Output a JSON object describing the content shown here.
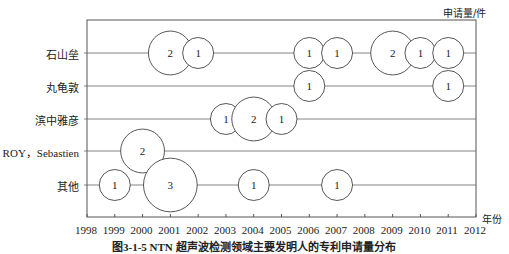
{
  "chart_data": {
    "type": "bubble",
    "title": "",
    "unit_label": "申请量/件",
    "xlabel": "年份",
    "ylabel": "",
    "x_ticks": [
      1998,
      1999,
      2000,
      2001,
      2002,
      2003,
      2004,
      2005,
      2006,
      2007,
      2008,
      2009,
      2010,
      2011,
      2012
    ],
    "xlim": [
      1998,
      2012
    ],
    "categories": [
      "石山垒",
      "丸龟敦",
      "滨中雅彦",
      "ROY，Sebastien",
      "其他"
    ],
    "series": [
      {
        "name": "石山垒",
        "points": [
          {
            "x": 2001,
            "v": 2
          },
          {
            "x": 2002,
            "v": 1
          },
          {
            "x": 2006,
            "v": 1
          },
          {
            "x": 2007,
            "v": 1
          },
          {
            "x": 2009,
            "v": 2
          },
          {
            "x": 2010,
            "v": 1
          },
          {
            "x": 2011,
            "v": 1
          }
        ]
      },
      {
        "name": "丸龟敦",
        "points": [
          {
            "x": 2006,
            "v": 1
          },
          {
            "x": 2011,
            "v": 1
          }
        ]
      },
      {
        "name": "滨中雅彦",
        "points": [
          {
            "x": 2003,
            "v": 1
          },
          {
            "x": 2004,
            "v": 2
          },
          {
            "x": 2005,
            "v": 1
          }
        ]
      },
      {
        "name": "ROY，Sebastien",
        "points": [
          {
            "x": 2000,
            "v": 2
          }
        ]
      },
      {
        "name": "其他",
        "points": [
          {
            "x": 1999,
            "v": 1
          },
          {
            "x": 2001,
            "v": 3
          },
          {
            "x": 2004,
            "v": 1
          },
          {
            "x": 2007,
            "v": 1
          }
        ]
      }
    ],
    "grid": false,
    "legend": "none"
  },
  "caption": "图3-1-5  NTN 超声波检测领域主要发明人的专利申请量分布"
}
